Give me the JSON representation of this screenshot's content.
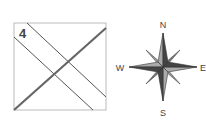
{
  "diagram": {
    "panel_number": "4",
    "compass": {
      "north": "N",
      "south": "S",
      "east": "E",
      "west": "W"
    }
  },
  "colors": {
    "box_border": "#bbbbbb",
    "thin_line": "#555555",
    "thick_line": "#666666",
    "star_dark": "#333333",
    "star_light": "#999999"
  }
}
